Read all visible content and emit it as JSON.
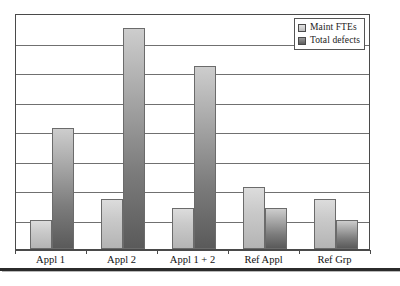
{
  "chart_data": {
    "type": "bar",
    "title": "",
    "subtitle": "",
    "xlabel": "",
    "ylabel": "",
    "categories": [
      "Appl 1",
      "Appl 2",
      "Appl 1 + 2",
      "Ref Appl",
      "Ref Grp"
    ],
    "series": [
      {
        "name": "Maint FTEs",
        "color": "#cacaca",
        "values": [
          1.0,
          1.7,
          1.4,
          2.1,
          1.7
        ]
      },
      {
        "name": "Total defects",
        "color": "#6e6e6e",
        "values": [
          4.1,
          7.5,
          6.2,
          1.4,
          1.0
        ]
      }
    ],
    "ylim": [
      0,
      8
    ],
    "y_gridline_count": 8,
    "y_tick_labels": [],
    "grid": true,
    "legend_position": "top-right",
    "annotations": []
  },
  "legend": {
    "entries": [
      {
        "label": "Maint FTEs",
        "swatch": "light-gray-gradient-swatch"
      },
      {
        "label": "Total defects",
        "swatch": "dark-gray-gradient-swatch"
      }
    ]
  },
  "axis": {
    "tick_labels": [
      "Appl 1",
      "Appl 2",
      "Appl 1 + 2",
      "Ref Appl",
      "Ref Grp"
    ]
  },
  "colors": {
    "frame": "#4a4a4a",
    "gridline": "#707070",
    "series_light_top": "#dcdcdc",
    "series_light_bottom": "#b4b4b4",
    "series_dark_top": "#cdcdcd",
    "series_dark_bottom": "#5a5a5a",
    "bottom_rule": "#2b2b2b",
    "text": "#111111"
  }
}
